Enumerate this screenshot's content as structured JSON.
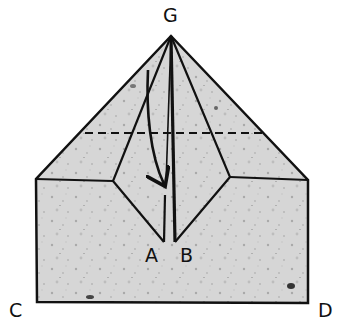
{
  "diagram": {
    "type": "origami-fold-step",
    "labels": {
      "G": "G",
      "A": "A",
      "B": "B",
      "C": "C",
      "D": "D"
    },
    "points": {
      "G": [
        171,
        36
      ],
      "A": [
        164,
        242
      ],
      "B": [
        175,
        242
      ],
      "C": [
        37,
        302
      ],
      "D": [
        308,
        303
      ],
      "outer_left": [
        36,
        179
      ],
      "outer_right": [
        308,
        180
      ],
      "inner_left": [
        113,
        181
      ],
      "inner_right": [
        230,
        177
      ]
    },
    "fold_line": {
      "style": "dashed",
      "from": [
        85,
        133
      ],
      "to": [
        265,
        133
      ]
    },
    "arrow": {
      "from": [
        148,
        70
      ],
      "to": [
        165,
        186
      ],
      "meaning": "fold down"
    },
    "colors": {
      "paper": "#d4d4d4",
      "line": "#111111",
      "background": "#ffffff"
    }
  }
}
